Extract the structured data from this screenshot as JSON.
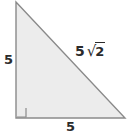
{
  "figure": {
    "type": "right-triangle-diagram",
    "background_color": "#ffffff",
    "fill_color": "#ececec",
    "stroke_color": "#8a8a8a",
    "label_color": "#2b2b2b",
    "vertices": {
      "apex": [
        16,
        2
      ],
      "right_angle": [
        16,
        118
      ],
      "bottom_right": [
        125,
        118
      ]
    },
    "right_angle_marker": {
      "present": true,
      "size": 9,
      "corner": "bottom-left"
    },
    "labels": {
      "left_leg": "5",
      "bottom_leg": "5",
      "hypotenuse_coefficient": "5",
      "hypotenuse_radical": "√",
      "hypotenuse_radicand": "2",
      "hypotenuse_full": "5√2"
    }
  }
}
